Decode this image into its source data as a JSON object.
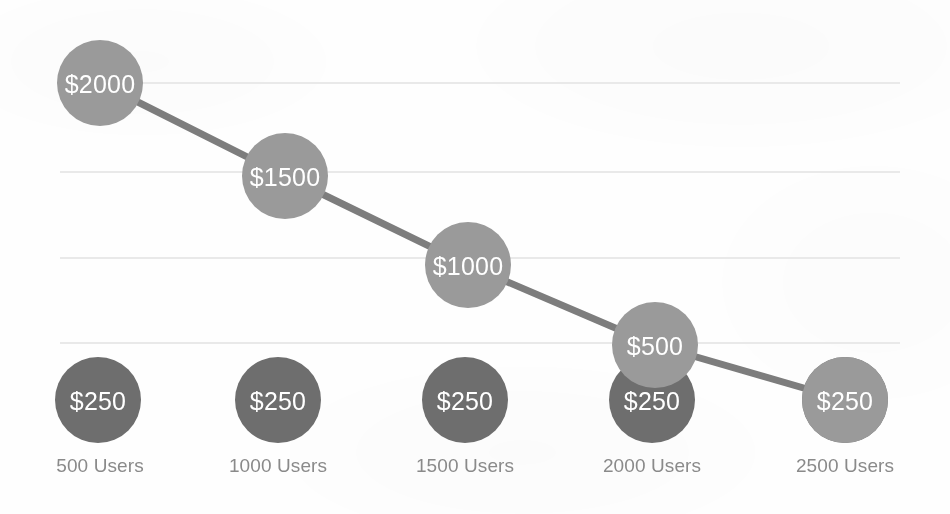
{
  "chart_data": {
    "type": "line",
    "title": "",
    "subtitle": "",
    "xlabel": "",
    "ylabel": "",
    "categories": [
      "500 Users",
      "1000 Users",
      "1500 Users",
      "2000 Users",
      "2500 Users"
    ],
    "x": [
      500,
      1000,
      1500,
      2000,
      2500
    ],
    "ylim": [
      0,
      2250
    ],
    "grid": true,
    "gridlines_y": [
      2000,
      1600,
      1200,
      800
    ],
    "legend": "none",
    "marker_style": "bubble",
    "series": [
      {
        "name": "Declining Price",
        "color": "#9a9a9a",
        "line_color": "#7d7d7d",
        "values": [
          2000,
          1500,
          1000,
          500,
          250
        ],
        "point_labels": [
          "$2000",
          "$1500",
          "$1000",
          "$500",
          "$250"
        ],
        "label_color": "#ffffff"
      },
      {
        "name": "Flat Price",
        "color": "#6e6e6e",
        "line_color": "#5e5e5e",
        "values": [
          250,
          250,
          250,
          250,
          250
        ],
        "point_labels": [
          "$250",
          "$250",
          "$250",
          "$250",
          "$250"
        ],
        "label_color": "#ffffff"
      }
    ],
    "tick_label_color": "#8a8a8a",
    "background_color": "#ffffff",
    "grid_color": "#e9e9e9"
  },
  "geometry": {
    "bubble_radius": 43,
    "line_width": 7,
    "points": {
      "declining": [
        {
          "cx": 100,
          "cy": 83,
          "label": "$2000"
        },
        {
          "cx": 285,
          "cy": 176,
          "label": "$1500"
        },
        {
          "cx": 468,
          "cy": 265,
          "label": "$1000"
        },
        {
          "cx": 655,
          "cy": 345,
          "label": "$500"
        },
        {
          "cx": 845,
          "cy": 400,
          "label": "$250"
        }
      ],
      "flat": [
        {
          "cx": 98,
          "cy": 400,
          "label": "$250"
        },
        {
          "cx": 278,
          "cy": 400,
          "label": "$250"
        },
        {
          "cx": 465,
          "cy": 400,
          "label": "$250"
        },
        {
          "cx": 652,
          "cy": 400,
          "label": "$250"
        },
        {
          "cx": 845,
          "cy": 400,
          "label": "$250"
        }
      ]
    },
    "gridline_y": [
      83,
      172,
      258,
      343
    ],
    "grid_x_start": 60,
    "grid_x_end": 900,
    "axis_label_x": [
      100,
      278,
      465,
      652,
      845
    ],
    "axis_label_y": 455
  }
}
